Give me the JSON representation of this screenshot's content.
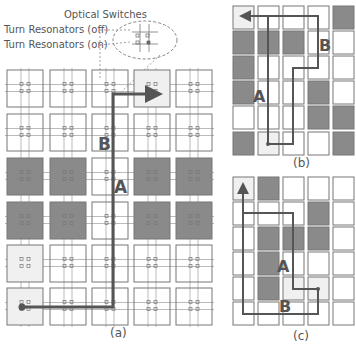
{
  "legend": {
    "title": "Optical Switches",
    "off_label": "Turn Resonators (off)",
    "on_label": "Turn Resonators (on)"
  },
  "colors": {
    "cell_border": "#777777",
    "cell_white": "#ffffff",
    "cell_light": "#f0f0f0",
    "cell_dark": "#8a8a8a",
    "path": "#555555",
    "waveguide": "#aaaaaa"
  },
  "panels": [
    {
      "id": "a",
      "caption": "(a)",
      "caption_pos": [
        110,
        337
      ],
      "cols_x": [
        7,
        50,
        92,
        134,
        176
      ],
      "rows_y": [
        70,
        114,
        158,
        202,
        245,
        288
      ],
      "cell_w": 36,
      "cell_h": 37,
      "with_switches": true,
      "grid": [
        [
          "w",
          "w",
          "w",
          "l",
          "w"
        ],
        [
          "w",
          "w",
          "w",
          "w",
          "w"
        ],
        [
          "d",
          "d",
          "w",
          "d",
          "d"
        ],
        [
          "d",
          "d",
          "w",
          "d",
          "d"
        ],
        [
          "l",
          "w",
          "w",
          "w",
          "w"
        ],
        [
          "l",
          "w",
          "w",
          "w",
          "w"
        ]
      ],
      "paths": [
        {
          "points": [
            [
              22,
              307
            ],
            [
              113,
              307
            ],
            [
              113,
              94
            ],
            [
              157,
              94
            ]
          ],
          "arrow": true,
          "start_dot": true
        }
      ],
      "labels": [
        {
          "text": "B",
          "x": 98,
          "y": 150
        },
        {
          "text": "A",
          "x": 114,
          "y": 193
        }
      ]
    },
    {
      "id": "b",
      "caption": "(b)",
      "caption_pos": [
        293,
        167
      ],
      "cols_x": [
        233,
        258,
        283,
        308,
        333
      ],
      "rows_y": [
        6,
        31,
        56,
        81,
        106,
        132
      ],
      "cell_w": 21,
      "cell_h": 23,
      "with_switches": false,
      "grid": [
        [
          "l",
          "w",
          "w",
          "w",
          "d"
        ],
        [
          "d",
          "d",
          "d",
          "w",
          "w"
        ],
        [
          "d",
          "w",
          "w",
          "w",
          "w"
        ],
        [
          "d",
          "w",
          "w",
          "d",
          "w"
        ],
        [
          "w",
          "w",
          "w",
          "d",
          "d"
        ],
        [
          "d",
          "l",
          "w",
          "w",
          "d"
        ]
      ],
      "paths": [
        {
          "points": [
            [
              268,
              144
            ],
            [
              293,
              144
            ],
            [
              293,
              68
            ],
            [
              318,
              68
            ],
            [
              318,
              16
            ],
            [
              243,
              16
            ]
          ],
          "arrow": true,
          "start_dot": true
        },
        {
          "points": [
            [
              268,
              144
            ],
            [
              268,
              16
            ]
          ],
          "arrow": false,
          "start_dot": false
        }
      ],
      "labels": [
        {
          "text": "B",
          "x": 319,
          "y": 51
        },
        {
          "text": "A",
          "x": 253,
          "y": 102
        }
      ]
    },
    {
      "id": "c",
      "caption": "(c)",
      "caption_pos": [
        293,
        340
      ],
      "cols_x": [
        233,
        258,
        283,
        308,
        333
      ],
      "rows_y": [
        177,
        202,
        227,
        252,
        277,
        302
      ],
      "cell_w": 21,
      "cell_h": 23,
      "with_switches": false,
      "grid": [
        [
          "l",
          "d",
          "w",
          "w",
          "w"
        ],
        [
          "w",
          "w",
          "w",
          "d",
          "w"
        ],
        [
          "w",
          "d",
          "d",
          "d",
          "w"
        ],
        [
          "w",
          "d",
          "w",
          "w",
          "w"
        ],
        [
          "w",
          "d",
          "l",
          "l",
          "w"
        ],
        [
          "w",
          "w",
          "w",
          "w",
          "w"
        ]
      ],
      "paths": [
        {
          "points": [
            [
              318,
              289
            ],
            [
              293,
              289
            ],
            [
              293,
              213
            ],
            [
              243,
              213
            ]
          ],
          "arrow": false,
          "start_dot": true
        },
        {
          "points": [
            [
              318,
              289
            ],
            [
              318,
              314
            ],
            [
              243,
              314
            ],
            [
              243,
              186
            ]
          ],
          "arrow": true,
          "start_dot": false
        }
      ],
      "labels": [
        {
          "text": "A",
          "x": 277,
          "y": 272
        },
        {
          "text": "B",
          "x": 279,
          "y": 312
        }
      ]
    }
  ]
}
